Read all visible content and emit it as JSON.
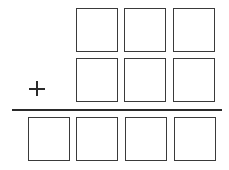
{
  "problem": {
    "operator": "+",
    "addend1_digits": [
      "",
      "",
      ""
    ],
    "addend2_digits": [
      "",
      "",
      ""
    ],
    "sum_digits": [
      "",
      "",
      "",
      ""
    ]
  }
}
